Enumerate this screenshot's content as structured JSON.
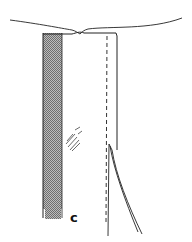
{
  "diagram": {
    "type": "sewing-technical-illustration",
    "label": "c",
    "elements": [
      {
        "name": "top-fabric-edge",
        "kind": "curve"
      },
      {
        "name": "shaded-facing-strip",
        "kind": "hatched-band"
      },
      {
        "name": "panel-outline",
        "kind": "rectangle"
      },
      {
        "name": "stitch-line",
        "kind": "dashed-line"
      },
      {
        "name": "slit-opening",
        "kind": "curved-lines"
      },
      {
        "name": "pressing-mark",
        "kind": "hatched-scribble"
      }
    ],
    "colors": {
      "ink": "#222222",
      "shade": "#8a8a8a",
      "background": "#ffffff"
    }
  }
}
